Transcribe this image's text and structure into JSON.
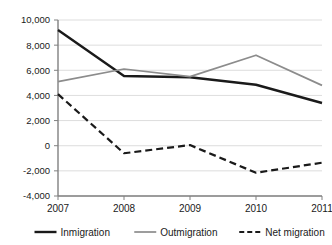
{
  "chart_data": {
    "type": "line",
    "title": "",
    "subtitle": "",
    "xlabel": "",
    "ylabel": "",
    "categories": [
      "2007",
      "2008",
      "2009",
      "2010",
      "2011"
    ],
    "x": [
      2007,
      2008,
      2009,
      2010,
      2011
    ],
    "series": [
      {
        "name": "Inmigration",
        "values": [
          9200,
          5550,
          5450,
          4850,
          3400
        ],
        "color": "#1a1a1a",
        "style": "solid",
        "width": 2.4
      },
      {
        "name": "Outmigration",
        "values": [
          5100,
          6100,
          5500,
          7200,
          4800
        ],
        "color": "#8c8c8c",
        "style": "solid",
        "width": 1.7
      },
      {
        "name": "Net migration",
        "values": [
          4100,
          -600,
          50,
          -2150,
          -1350
        ],
        "color": "#1a1a1a",
        "style": "dashed",
        "width": 2.2
      }
    ],
    "ylim": [
      -4000,
      10000
    ],
    "yticks": [
      10000,
      8000,
      6000,
      4000,
      2000,
      0,
      -2000,
      -4000
    ],
    "ytick_labels": [
      "10,000",
      "8,000",
      "6,000",
      "4,000",
      "2,000",
      "0",
      "-2,000",
      "-4,000"
    ],
    "grid": true,
    "grid_axis": "y",
    "legend_position": "bottom",
    "legend": [
      {
        "label": "Inmigration",
        "color": "#1a1a1a",
        "style": "solid"
      },
      {
        "label": "Outmigration",
        "color": "#8c8c8c",
        "style": "solid"
      },
      {
        "label": "Net migration",
        "color": "#1a1a1a",
        "style": "dashed"
      }
    ]
  },
  "colors": {
    "inmigration": "#1a1a1a",
    "outmigration": "#8c8c8c",
    "net_migration": "#1a1a1a",
    "gridline": "#d4d4d4",
    "axis": "#808080",
    "background": "#ffffff"
  }
}
